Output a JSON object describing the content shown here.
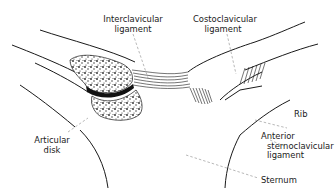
{
  "figure": {
    "colors": {
      "ink": "#1a1a1a",
      "leader": "#888888",
      "background": "#ffffff"
    }
  },
  "labels": {
    "interclavicular": {
      "line1": "Interclavicular",
      "line2": "ligament"
    },
    "costoclavicular": {
      "line1": "Costoclavicular",
      "line2": "ligament"
    },
    "rib": {
      "line1": "Rib"
    },
    "anterior_sternoclavicular": {
      "line1": "Anterior",
      "line2": "sternoclavicular",
      "line3": "ligament"
    },
    "sternum": {
      "line1": "Sternum"
    },
    "articular_disk": {
      "line1": "Articular",
      "line2": "disk"
    }
  }
}
